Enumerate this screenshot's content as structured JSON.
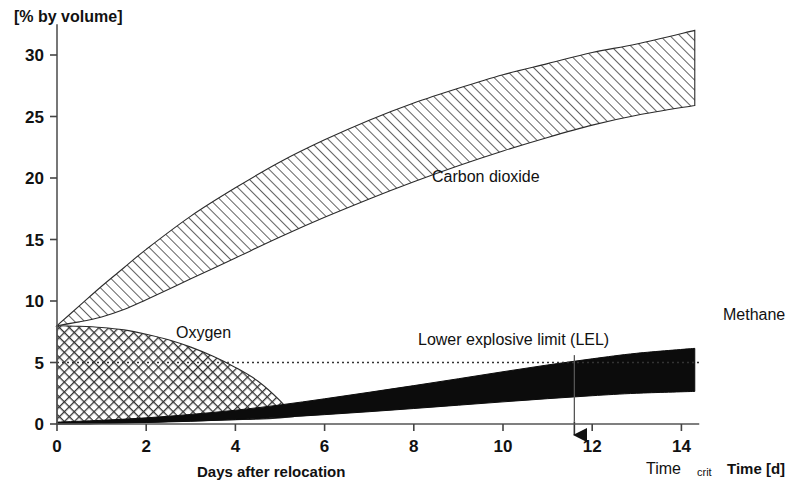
{
  "chart_data": {
    "type": "area",
    "title": "",
    "ylabel": "[% by volume]",
    "xlabel": "Days after relocation",
    "xlabel_right": "Time [d]",
    "xlim": [
      0,
      14.4
    ],
    "ylim": [
      0,
      32.5
    ],
    "xticks": [
      0,
      2,
      4,
      6,
      8,
      10,
      12,
      14
    ],
    "xtick_labels": [
      "0",
      "2",
      "4",
      "6",
      "8",
      "10",
      "12",
      "14"
    ],
    "yticks": [
      0,
      5,
      10,
      15,
      20,
      25,
      30
    ],
    "ytick_labels": [
      "0",
      "5",
      "10",
      "15",
      "20",
      "25",
      "30"
    ],
    "grid": false,
    "legend_position": "inline-annotations",
    "series": [
      {
        "name": "Carbon dioxide",
        "label": "Carbon dioxide",
        "fill": "diagonal-hatch",
        "band_x": [
          0,
          0.5,
          1,
          1.5,
          2,
          3,
          4,
          5,
          6,
          7,
          8,
          9,
          10,
          11,
          12,
          13,
          14.3
        ],
        "band_upper": [
          8.0,
          9.6,
          11.2,
          12.7,
          14.2,
          16.9,
          19.2,
          21.3,
          23.1,
          24.7,
          26.1,
          27.3,
          28.4,
          29.3,
          30.2,
          30.9,
          32.0
        ],
        "band_lower": [
          8.0,
          8.3,
          8.7,
          9.3,
          10.1,
          11.8,
          13.5,
          15.2,
          16.8,
          18.3,
          19.7,
          21.0,
          22.2,
          23.3,
          24.3,
          25.1,
          25.9
        ]
      },
      {
        "name": "Oxygen",
        "label": "Oxygen",
        "fill": "cross-hatch",
        "band_x": [
          0,
          0.5,
          1,
          1.5,
          2,
          2.5,
          3,
          3.5,
          4,
          4.5,
          5,
          5.3
        ],
        "band_upper": [
          8.0,
          7.95,
          7.85,
          7.65,
          7.3,
          6.85,
          6.25,
          5.5,
          4.6,
          3.5,
          1.9,
          0.6
        ],
        "band_lower": [
          0.0,
          0.0,
          0.05,
          0.1,
          0.15,
          0.2,
          0.25,
          0.3,
          0.35,
          0.4,
          0.5,
          0.6
        ]
      },
      {
        "name": "Methane",
        "label": "Methane",
        "fill": "solid-black",
        "band_x": [
          0,
          1,
          2,
          3,
          4,
          5,
          6,
          7,
          8,
          9,
          10,
          11,
          12,
          13,
          14.3
        ],
        "band_upper": [
          0.15,
          0.3,
          0.5,
          0.78,
          1.12,
          1.55,
          2.05,
          2.58,
          3.12,
          3.68,
          4.25,
          4.8,
          5.3,
          5.75,
          6.15
        ],
        "band_lower": [
          0.0,
          0.05,
          0.12,
          0.22,
          0.36,
          0.54,
          0.76,
          1.0,
          1.26,
          1.53,
          1.8,
          2.06,
          2.3,
          2.5,
          2.65
        ]
      }
    ],
    "annotations": [
      {
        "name": "lower-explosive-limit",
        "label": "Lower explosive limit (LEL)",
        "type": "hline-dotted",
        "y": 5.0,
        "x_start": 0.0,
        "x_end": 14.4
      },
      {
        "name": "time-crit",
        "label": "Time",
        "label_sub": "crit",
        "type": "vline-arrow",
        "x": 11.6,
        "y_top": 5.6,
        "y_bottom": -0.9
      }
    ]
  }
}
